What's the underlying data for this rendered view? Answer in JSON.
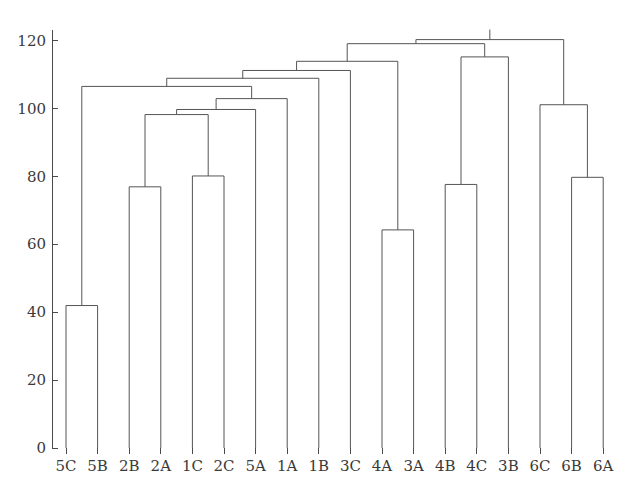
{
  "chart_data": {
    "type": "dendrogram",
    "title": "",
    "xlabel": "",
    "ylabel": "",
    "ylim": [
      0,
      125
    ],
    "yticks": [
      0,
      20,
      40,
      60,
      80,
      100,
      120
    ],
    "ytick_labels": [
      "0",
      "20",
      "40",
      "60",
      "80",
      "100",
      "120"
    ],
    "grid": false,
    "legend": "none",
    "leaf_order": [
      "5C",
      "5B",
      "2B",
      "2A",
      "1C",
      "2C",
      "5A",
      "1A",
      "1B",
      "3C",
      "4A",
      "3A",
      "4B",
      "4C",
      "3B",
      "6C",
      "6B",
      "6A"
    ],
    "line_color": "#555555",
    "axis_color": "#4a4a4a",
    "merges": [
      {
        "id": "n1",
        "left": "5C",
        "right": "5B",
        "height": 42.0
      },
      {
        "id": "n2",
        "left": "2B",
        "right": "2A",
        "height": 77.0
      },
      {
        "id": "n3",
        "left": "1C",
        "right": "2C",
        "height": 80.2
      },
      {
        "id": "n4",
        "left": "4A",
        "right": "3A",
        "height": 64.3
      },
      {
        "id": "n5",
        "left": "4B",
        "right": "4C",
        "height": 77.7
      },
      {
        "id": "n6",
        "left": "6B",
        "right": "6A",
        "height": 79.8
      },
      {
        "id": "n7",
        "left": "n2",
        "right": "n3",
        "height": 98.3
      },
      {
        "id": "n8",
        "left": "n7",
        "right": "5A",
        "height": 99.8
      },
      {
        "id": "n9",
        "left": "6C",
        "right": "n6",
        "height": 101.2
      },
      {
        "id": "n10",
        "left": "n8",
        "right": "1A",
        "height": 103.0
      },
      {
        "id": "n11",
        "left": "n1",
        "right": "n10",
        "height": 106.6
      },
      {
        "id": "n12",
        "left": "n11",
        "right": "1B",
        "height": 109.0
      },
      {
        "id": "n13",
        "left": "n12",
        "right": "3C",
        "height": 111.3
      },
      {
        "id": "n14",
        "left": "n13",
        "right": "n4",
        "height": 114.0
      },
      {
        "id": "n15",
        "left": "n5",
        "right": "3B",
        "height": 115.3
      },
      {
        "id": "n16",
        "left": "n14",
        "right": "n15",
        "height": 119.2
      },
      {
        "id": "n17",
        "left": "n16",
        "right": "n9",
        "height": 120.4
      }
    ]
  },
  "axis": {
    "y_axis_name": "y-axis",
    "x_axis_name": "x-axis"
  }
}
